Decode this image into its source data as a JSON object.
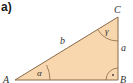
{
  "diagram": {
    "part_label": "a)",
    "vertices": {
      "A": "A",
      "B": "B",
      "C": "C"
    },
    "sides": {
      "a": "a",
      "b": "b",
      "c": "c"
    },
    "angles": {
      "alpha": "α",
      "gamma": "γ",
      "right_angle_marker": "·"
    },
    "colors": {
      "fill": "#f8d7ae",
      "stroke": "#8a6a4a"
    }
  }
}
